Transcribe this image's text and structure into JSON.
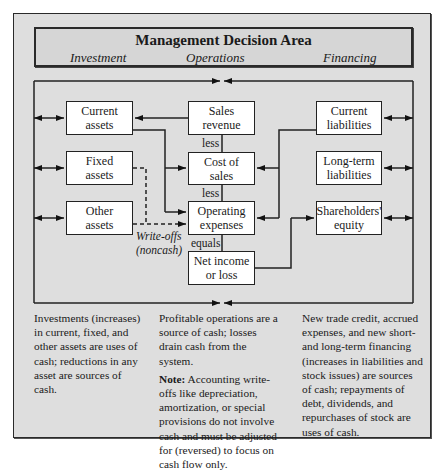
{
  "header": {
    "title": "Management Decision Area",
    "columns": [
      "Investment",
      "Operations",
      "Financing"
    ]
  },
  "nodes": {
    "current_assets": "Current\nassets",
    "fixed_assets": "Fixed\nassets",
    "other_assets": "Other\nassets",
    "sales_revenue": "Sales\nrevenue",
    "cost_of_sales": "Cost of\nsales",
    "operating_expenses": "Operating\nexpenses",
    "net_income": "Net income\nor loss",
    "current_liabilities": "Current\nliabilities",
    "long_term_liabilities": "Long-term\nliabilities",
    "shareholders_equity": "Shareholders'\nequity"
  },
  "connectors": {
    "less_1": "less",
    "less_2": "less",
    "equals": "equals",
    "writeoffs_line1": "Write-offs",
    "writeoffs_line2": "(noncash)"
  },
  "notes": {
    "investment": "Investments (increases) in current, fixed, and other assets are uses of cash; reductions in any asset are sources of cash.",
    "operations": "Profitable operations are a source of cash; losses drain cash from the system.",
    "operations_note_label": "Note:",
    "operations_note_text": " Accounting write-offs like depreciation, amortization, or special provisions do not involve cash and must be adjusted for (reversed) to focus on cash flow only.",
    "financing": "New trade credit, accrued expenses, and new short- and long-term financing (increases in liabilities and stock issues) are sources of cash; repayments of debt, dividends, and repurchases of stock are uses of cash."
  }
}
